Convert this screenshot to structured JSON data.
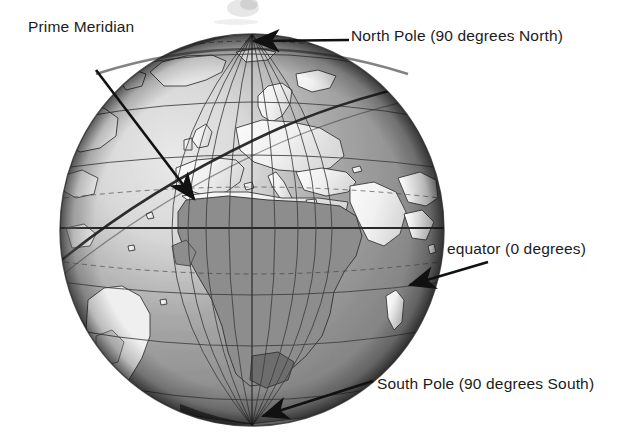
{
  "figure": {
    "type": "globe-diagram",
    "background_color": "#ffffff",
    "text_color": "#1b1b1b",
    "ocean_color": "#8d8d8d",
    "land_color": "#f2f2f2",
    "grid_color": "#4a4a4a",
    "highlight_color": "#1a1a1a"
  },
  "globe": {
    "center_x": 252,
    "center_y": 230,
    "radius_x": 192,
    "radius_y": 196,
    "meridian_count": 12,
    "parallel_count": 9,
    "equator_label": "equator",
    "prime_meridian_label": "Prime Meridian"
  },
  "labels": {
    "prime_meridian": "Prime Meridian",
    "north_pole": "North Pole (90 degrees North)",
    "equator": "equator (0 degrees)",
    "south_pole": "South Pole (90 degrees South)"
  },
  "annotations": [
    {
      "name": "prime-meridian",
      "text": "Prime Meridian",
      "line_start": {
        "x": 96,
        "y": 70
      },
      "line_end": {
        "x": 198,
        "y": 205
      },
      "arrow_at": "end"
    },
    {
      "name": "north-pole",
      "text": "North Pole (90 degrees North)",
      "line_start": {
        "x": 348,
        "y": 40
      },
      "line_end": {
        "x": 248,
        "y": 41
      },
      "arrow_at": "end"
    },
    {
      "name": "equator",
      "text": "equator (0 degrees)",
      "line_start": {
        "x": 487,
        "y": 263
      },
      "line_end": {
        "x": 404,
        "y": 288
      },
      "arrow_at": "end"
    },
    {
      "name": "south-pole",
      "text": "South Pole (90 degrees South)",
      "line_start": {
        "x": 372,
        "y": 382
      },
      "line_end": {
        "x": 256,
        "y": 419
      },
      "arrow_at": "end"
    }
  ]
}
